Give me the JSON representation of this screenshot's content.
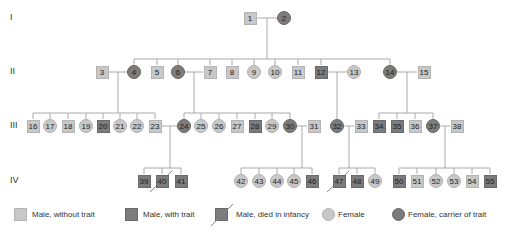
{
  "generations": [
    {
      "label": "I",
      "y": 18
    },
    {
      "label": "II",
      "y": 72
    },
    {
      "label": "III",
      "y": 126
    },
    {
      "label": "IV",
      "y": 181
    }
  ],
  "colors": {
    "unaffected": "#c8c8c8",
    "affected": "#7c7c7c",
    "line": "#aaaaaa"
  },
  "individuals": [
    {
      "id": "1",
      "gen": 0,
      "x": 250,
      "sex": "male",
      "status": "without-trait"
    },
    {
      "id": "2",
      "gen": 0,
      "x": 284,
      "sex": "female",
      "status": "carrier"
    },
    {
      "id": "3",
      "gen": 1,
      "x": 102,
      "sex": "male",
      "status": "without-trait"
    },
    {
      "id": "4",
      "gen": 1,
      "x": 134,
      "sex": "female",
      "status": "carrier"
    },
    {
      "id": "5",
      "gen": 1,
      "x": 157,
      "sex": "male",
      "status": "without-trait"
    },
    {
      "id": "6",
      "gen": 1,
      "x": 178,
      "sex": "female",
      "status": "carrier"
    },
    {
      "id": "7",
      "gen": 1,
      "x": 210,
      "sex": "male",
      "status": "without-trait"
    },
    {
      "id": "8",
      "gen": 1,
      "x": 232,
      "sex": "male",
      "status": "without-trait"
    },
    {
      "id": "9",
      "gen": 1,
      "x": 254,
      "sex": "female",
      "status": "normal"
    },
    {
      "id": "10",
      "gen": 1,
      "x": 275,
      "sex": "female",
      "status": "normal"
    },
    {
      "id": "11",
      "gen": 1,
      "x": 298,
      "sex": "male",
      "status": "without-trait"
    },
    {
      "id": "12",
      "gen": 1,
      "x": 321,
      "sex": "male",
      "status": "with-trait"
    },
    {
      "id": "13",
      "gen": 1,
      "x": 354,
      "sex": "female",
      "status": "normal"
    },
    {
      "id": "14",
      "gen": 1,
      "x": 390,
      "sex": "female",
      "status": "carrier"
    },
    {
      "id": "15",
      "gen": 1,
      "x": 424,
      "sex": "male",
      "status": "without-trait"
    },
    {
      "id": "16",
      "gen": 2,
      "x": 33,
      "sex": "male",
      "status": "without-trait"
    },
    {
      "id": "17",
      "gen": 2,
      "x": 50,
      "sex": "female",
      "status": "normal"
    },
    {
      "id": "18",
      "gen": 2,
      "x": 68,
      "sex": "male",
      "status": "without-trait"
    },
    {
      "id": "19",
      "gen": 2,
      "x": 86,
      "sex": "female",
      "status": "normal"
    },
    {
      "id": "20",
      "gen": 2,
      "x": 103,
      "sex": "male",
      "status": "with-trait"
    },
    {
      "id": "21",
      "gen": 2,
      "x": 120,
      "sex": "female",
      "status": "normal"
    },
    {
      "id": "22",
      "gen": 2,
      "x": 137,
      "sex": "female",
      "status": "normal"
    },
    {
      "id": "23",
      "gen": 2,
      "x": 155,
      "sex": "male",
      "status": "without-trait"
    },
    {
      "id": "24",
      "gen": 2,
      "x": 184,
      "sex": "female",
      "status": "carrier"
    },
    {
      "id": "25",
      "gen": 2,
      "x": 201,
      "sex": "female",
      "status": "normal"
    },
    {
      "id": "26",
      "gen": 2,
      "x": 219,
      "sex": "female",
      "status": "normal"
    },
    {
      "id": "27",
      "gen": 2,
      "x": 237,
      "sex": "male",
      "status": "without-trait"
    },
    {
      "id": "28",
      "gen": 2,
      "x": 255,
      "sex": "male",
      "status": "with-trait"
    },
    {
      "id": "29",
      "gen": 2,
      "x": 272,
      "sex": "female",
      "status": "normal"
    },
    {
      "id": "30",
      "gen": 2,
      "x": 290,
      "sex": "female",
      "status": "carrier"
    },
    {
      "id": "31",
      "gen": 2,
      "x": 314,
      "sex": "male",
      "status": "without-trait"
    },
    {
      "id": "32",
      "gen": 2,
      "x": 337,
      "sex": "female",
      "status": "carrier"
    },
    {
      "id": "33",
      "gen": 2,
      "x": 361,
      "sex": "male",
      "status": "without-trait"
    },
    {
      "id": "34",
      "gen": 2,
      "x": 379,
      "sex": "male",
      "status": "with-trait"
    },
    {
      "id": "35",
      "gen": 2,
      "x": 397,
      "sex": "male",
      "status": "with-trait"
    },
    {
      "id": "36",
      "gen": 2,
      "x": 415,
      "sex": "male",
      "status": "without-trait"
    },
    {
      "id": "37",
      "gen": 2,
      "x": 433,
      "sex": "female",
      "status": "carrier"
    },
    {
      "id": "38",
      "gen": 2,
      "x": 457,
      "sex": "male",
      "status": "without-trait"
    },
    {
      "id": "39",
      "gen": 3,
      "x": 144,
      "sex": "male",
      "status": "with-trait"
    },
    {
      "id": "40",
      "gen": 3,
      "x": 162,
      "sex": "male",
      "status": "died-in-infancy"
    },
    {
      "id": "41",
      "gen": 3,
      "x": 181,
      "sex": "male",
      "status": "with-trait"
    },
    {
      "id": "42",
      "gen": 3,
      "x": 241,
      "sex": "female",
      "status": "normal"
    },
    {
      "id": "43",
      "gen": 3,
      "x": 259,
      "sex": "female",
      "status": "normal"
    },
    {
      "id": "44",
      "gen": 3,
      "x": 277,
      "sex": "female",
      "status": "normal"
    },
    {
      "id": "45",
      "gen": 3,
      "x": 294,
      "sex": "female",
      "status": "normal"
    },
    {
      "id": "46",
      "gen": 3,
      "x": 312,
      "sex": "male",
      "status": "with-trait"
    },
    {
      "id": "47",
      "gen": 3,
      "x": 339,
      "sex": "male",
      "status": "died-in-infancy"
    },
    {
      "id": "48",
      "gen": 3,
      "x": 357,
      "sex": "male",
      "status": "with-trait"
    },
    {
      "id": "49",
      "gen": 3,
      "x": 375,
      "sex": "female",
      "status": "normal"
    },
    {
      "id": "50",
      "gen": 3,
      "x": 399,
      "sex": "male",
      "status": "with-trait"
    },
    {
      "id": "51",
      "gen": 3,
      "x": 417,
      "sex": "male",
      "status": "without-trait"
    },
    {
      "id": "52",
      "gen": 3,
      "x": 436,
      "sex": "female",
      "status": "normal"
    },
    {
      "id": "53",
      "gen": 3,
      "x": 454,
      "sex": "female",
      "status": "normal"
    },
    {
      "id": "54",
      "gen": 3,
      "x": 472,
      "sex": "male",
      "status": "without-trait"
    },
    {
      "id": "55",
      "gen": 3,
      "x": 490,
      "sex": "male",
      "status": "with-trait"
    }
  ],
  "couples": [
    {
      "a": "1",
      "b": "2",
      "dropX": 267,
      "children": [
        "4",
        "5",
        "6",
        "7",
        "8",
        "9",
        "10",
        "11",
        "12",
        "14"
      ]
    },
    {
      "a": "3",
      "b": "4",
      "dropX": 118,
      "children": [
        "16",
        "17",
        "18",
        "19",
        "20",
        "21",
        "22",
        "23"
      ]
    },
    {
      "a": "6",
      "b": "7",
      "dropX": 194,
      "children": [
        "24",
        "25",
        "26",
        "27",
        "28",
        "29",
        "30"
      ]
    },
    {
      "a": "12",
      "b": "13",
      "dropX": 337,
      "children": [
        "32"
      ]
    },
    {
      "a": "14",
      "b": "15",
      "dropX": 407,
      "children": [
        "34",
        "35",
        "36",
        "37"
      ]
    },
    {
      "a": "23",
      "b": "24",
      "dropX": 170,
      "children": [
        "39",
        "40",
        "41"
      ]
    },
    {
      "a": "30",
      "b": "31",
      "dropX": 302,
      "children": [
        "42",
        "43",
        "44",
        "45",
        "46"
      ]
    },
    {
      "a": "32",
      "b": "33",
      "dropX": 349,
      "children": [
        "47",
        "48",
        "49"
      ]
    },
    {
      "a": "37",
      "b": "38",
      "dropX": 445,
      "children": [
        "50",
        "51",
        "52",
        "53",
        "54",
        "55"
      ]
    }
  ],
  "legend": [
    {
      "key": "male-without-trait",
      "shape": "square",
      "tone": "light",
      "label": "Male, without trait",
      "x": 14
    },
    {
      "key": "male-with-trait",
      "shape": "square",
      "tone": "dark",
      "label": "Male, with trait",
      "x": 125
    },
    {
      "key": "male-died-infancy",
      "shape": "square-slash",
      "tone": "dark",
      "label": "Male, died in infancy",
      "x": 215
    },
    {
      "key": "female",
      "shape": "circle",
      "tone": "light",
      "label": "Female",
      "x": 322
    },
    {
      "key": "female-carrier",
      "shape": "circle",
      "tone": "dark",
      "label": "Female, carrier of trait",
      "x": 392
    }
  ]
}
